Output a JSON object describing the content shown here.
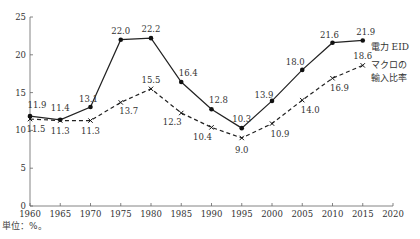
{
  "chart_data": {
    "type": "line",
    "title": "",
    "xlabel": "",
    "ylabel": "",
    "unit_note": "単位：%。",
    "x": [
      1960,
      1965,
      1970,
      1975,
      1980,
      1985,
      1990,
      1995,
      2000,
      2005,
      2010,
      2015
    ],
    "xlim": [
      1960,
      2020
    ],
    "ylim": [
      0,
      25
    ],
    "x_ticks": [
      1960,
      1965,
      1970,
      1975,
      1980,
      1985,
      1990,
      1995,
      2000,
      2005,
      2010,
      2015,
      2020
    ],
    "y_ticks": [
      0,
      5,
      10,
      15,
      20,
      25
    ],
    "grid": false,
    "series": [
      {
        "name": "電力 EID",
        "style": "solid",
        "marker": "dot",
        "values": [
          11.9,
          11.4,
          13.1,
          22.0,
          22.2,
          16.4,
          12.8,
          10.3,
          13.9,
          18.0,
          21.6,
          21.9
        ]
      },
      {
        "name": "マクロの輸入比率",
        "style": "dashed",
        "marker": "x",
        "values": [
          11.5,
          11.3,
          11.3,
          13.7,
          15.5,
          12.3,
          10.4,
          9.0,
          10.9,
          14.0,
          16.9,
          18.6
        ]
      }
    ],
    "legend": [
      {
        "label": "電力 EID",
        "position": "end-of-line"
      },
      {
        "label_line1": "マクロの",
        "label_line2": "輸入比率",
        "position": "end-of-line"
      }
    ]
  }
}
